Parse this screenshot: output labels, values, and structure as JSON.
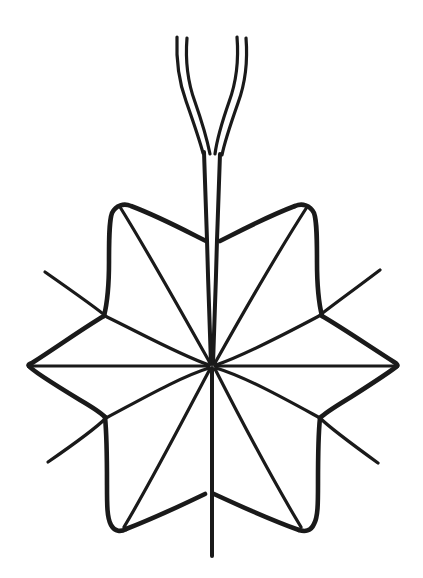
{
  "figure": {
    "domain": "Natural-Image",
    "kind": "hand-drawn-botanical-line-illustration",
    "title": "Palmately lobed leaf with forked petiole",
    "subject_name": "leaf-diagram",
    "background_color": "#ffffff",
    "ink_color": "#1a1a1a",
    "canvas": {
      "width": 423,
      "height": 578
    }
  },
  "geometry": {
    "center": {
      "x": 212,
      "y": 366
    },
    "lobe_count": 8,
    "radiating_veins": 12,
    "outer_tips": [
      {
        "name": "left-tip",
        "x": 28,
        "y": 366
      },
      {
        "name": "right-tip",
        "x": 398,
        "y": 366
      },
      {
        "name": "upper-left-lobe",
        "x": 118,
        "y": 205
      },
      {
        "name": "upper-right-lobe",
        "x": 310,
        "y": 205
      },
      {
        "name": "lower-left-lobe",
        "x": 123,
        "y": 530
      },
      {
        "name": "lower-right-lobe",
        "x": 303,
        "y": 530
      }
    ],
    "free_arm_tips": [
      {
        "name": "arm-upper-left",
        "x": 45,
        "y": 272
      },
      {
        "name": "arm-upper-right",
        "x": 380,
        "y": 270
      },
      {
        "name": "arm-lower-left",
        "x": 48,
        "y": 462
      },
      {
        "name": "arm-lower-right",
        "x": 378,
        "y": 463
      },
      {
        "name": "arm-lower-center",
        "x": 212,
        "y": 556
      }
    ],
    "stem": {
      "notch_y": 240,
      "fork_y": 152,
      "branch_tips_y": 36,
      "left_branch_x": [
        177,
        186
      ],
      "right_branch_x": [
        237,
        245
      ]
    }
  },
  "labels": {
    "stem": "stem",
    "left_branch": "left-stem-branch",
    "right_branch": "right-stem-branch",
    "center_node": "vein-convergence-point",
    "outline": "leaf-outline",
    "veins": "leaf-veins"
  }
}
